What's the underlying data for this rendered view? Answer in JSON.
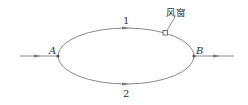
{
  "diagram": {
    "type": "ventilation-network",
    "nodes": [
      {
        "id": "A",
        "label": "A"
      },
      {
        "id": "B",
        "label": "B"
      }
    ],
    "branches": [
      {
        "id": "1",
        "label": "1",
        "from": "A",
        "to": "B",
        "position": "upper"
      },
      {
        "id": "2",
        "label": "2",
        "from": "A",
        "to": "B",
        "position": "lower"
      }
    ],
    "regulator": {
      "label": "风窗",
      "on_branch": "1"
    },
    "inlet_arrow": "into A",
    "outlet_arrow": "out of B"
  },
  "colors": {
    "line": "#8a8a8a",
    "text": "#333333",
    "node": "#555555"
  }
}
